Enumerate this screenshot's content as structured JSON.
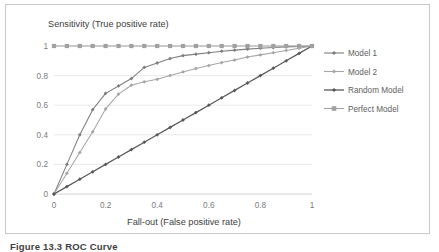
{
  "figure": {
    "caption": "Figure 13.3 ROC Curve",
    "border_color": "#c9c9c9",
    "background": "#ffffff"
  },
  "chart_data": {
    "type": "line",
    "title": "",
    "xlabel": "Fall-out (False positive rate)",
    "ylabel": "Sensitivity (True positive rate)",
    "xlim": [
      0,
      1
    ],
    "ylim": [
      0,
      1
    ],
    "xticks": [
      "0",
      "0.2",
      "0.4",
      "0.6",
      "0.8",
      "1"
    ],
    "yticks": [
      "0",
      "0.2",
      "0.4",
      "0.6",
      "0.8",
      "1"
    ],
    "xtick_values": [
      0,
      0.2,
      0.4,
      0.6,
      0.8,
      1
    ],
    "ytick_values": [
      0,
      0.2,
      0.4,
      0.6,
      0.8,
      1
    ],
    "grid": "horizontal",
    "legend_position": "right",
    "x": [
      0,
      0.05,
      0.1,
      0.15,
      0.2,
      0.25,
      0.3,
      0.35,
      0.4,
      0.45,
      0.5,
      0.55,
      0.6,
      0.65,
      0.7,
      0.75,
      0.8,
      0.85,
      0.9,
      0.95,
      1
    ],
    "series": [
      {
        "name": "Model 1",
        "color": "#7f7f7f",
        "marker": "diamond",
        "values": [
          0,
          0.2,
          0.4,
          0.57,
          0.68,
          0.73,
          0.78,
          0.855,
          0.885,
          0.915,
          0.935,
          0.945,
          0.955,
          0.965,
          0.972,
          0.979,
          0.985,
          0.99,
          0.994,
          0.997,
          1
        ]
      },
      {
        "name": "Model 2",
        "color": "#a6a6a6",
        "marker": "diamond",
        "values": [
          0,
          0.14,
          0.28,
          0.42,
          0.575,
          0.675,
          0.735,
          0.758,
          0.775,
          0.8,
          0.825,
          0.848,
          0.868,
          0.888,
          0.905,
          0.925,
          0.94,
          0.955,
          0.97,
          0.985,
          1
        ]
      },
      {
        "name": "Random Model",
        "color": "#595959",
        "marker": "diamond",
        "values": [
          0,
          0.05,
          0.1,
          0.15,
          0.2,
          0.25,
          0.3,
          0.35,
          0.4,
          0.45,
          0.5,
          0.55,
          0.6,
          0.65,
          0.7,
          0.75,
          0.8,
          0.85,
          0.9,
          0.95,
          1
        ]
      },
      {
        "name": "Perfect Model",
        "color": "#a0a0a0",
        "marker": "square",
        "values": [
          1,
          1,
          1,
          1,
          1,
          1,
          1,
          1,
          1,
          1,
          1,
          1,
          1,
          1,
          1,
          1,
          1,
          1,
          1,
          1,
          1
        ]
      }
    ]
  }
}
